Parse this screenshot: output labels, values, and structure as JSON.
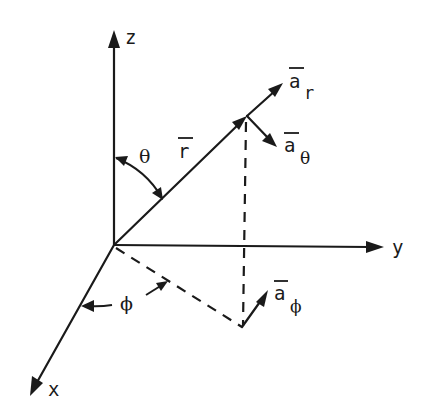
{
  "diagram": {
    "axes": {
      "z": {
        "label": "z"
      },
      "y": {
        "label": "y"
      },
      "x": {
        "label": "x"
      }
    },
    "vectors": {
      "r": {
        "label": "r",
        "overbar": true
      },
      "a_r": {
        "label": "a",
        "subscript": "r",
        "overbar": true
      },
      "a_theta": {
        "label": "a",
        "subscript": "θ",
        "overbar": true
      },
      "a_phi": {
        "label": "a",
        "subscript": "ϕ",
        "overbar": true
      }
    },
    "angles": {
      "theta": {
        "label": "θ"
      },
      "phi": {
        "label": "ϕ"
      }
    },
    "colors": {
      "ink": "#1a1a1a",
      "background": "#ffffff"
    }
  }
}
